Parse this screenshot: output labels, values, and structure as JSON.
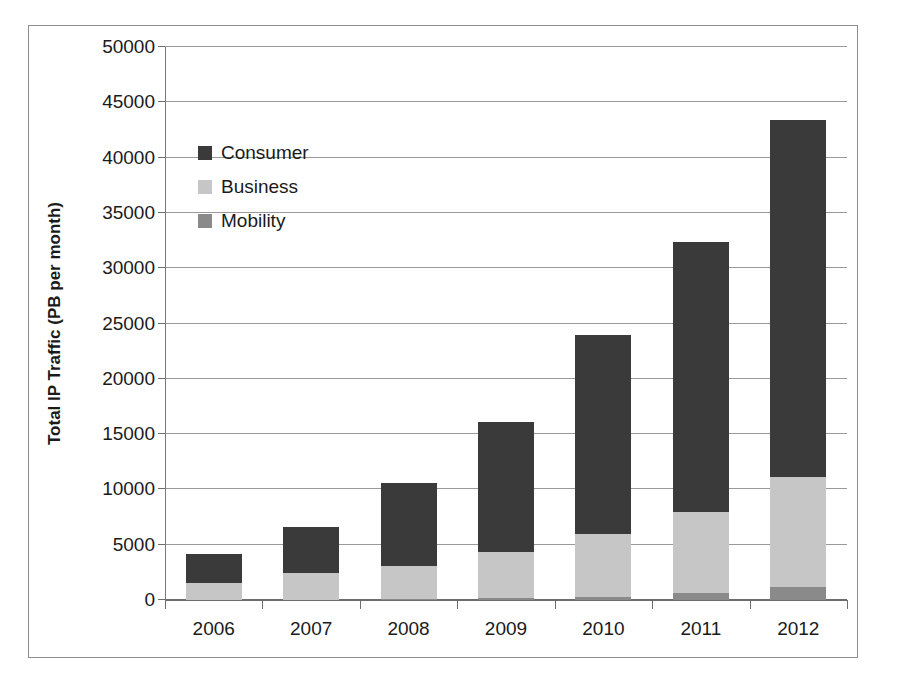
{
  "chart_data": {
    "type": "bar",
    "title": "",
    "subtitle": "",
    "xlabel": "",
    "ylabel": "Total IP Traffic (PB per month)",
    "categories": [
      "2006",
      "2007",
      "2008",
      "2009",
      "2010",
      "2011",
      "2012"
    ],
    "ylim": [
      0,
      50000
    ],
    "ytick_labels": [
      "0",
      "5000",
      "10000",
      "15000",
      "20000",
      "25000",
      "30000",
      "35000",
      "40000",
      "45000",
      "50000"
    ],
    "ytick_values": [
      0,
      5000,
      10000,
      15000,
      20000,
      25000,
      30000,
      35000,
      40000,
      45000,
      50000
    ],
    "grid": true,
    "stacked": true,
    "legend_position": "upper-left-inside",
    "series": [
      {
        "name": "Mobility",
        "color": "#8a8a8a",
        "values": [
          10,
          30,
          90,
          200,
          300,
          600,
          1200
        ]
      },
      {
        "name": "Business",
        "color": "#c6c6c6",
        "values": [
          1490,
          2370,
          3010,
          4100,
          5700,
          7400,
          9900
        ]
      },
      {
        "name": "Consumer",
        "color": "#3a3a3a",
        "values": [
          2700,
          4200,
          7500,
          11800,
          18000,
          24400,
          32300
        ]
      }
    ],
    "totals": [
      4200,
      6600,
      10600,
      16100,
      24000,
      32400,
      43400
    ],
    "stack_order_bottom_to_top": [
      "Mobility",
      "Business",
      "Consumer"
    ]
  },
  "legend": {
    "items": [
      {
        "label": "Consumer",
        "color": "#3a3a3a"
      },
      {
        "label": "Business",
        "color": "#c6c6c6"
      },
      {
        "label": "Mobility",
        "color": "#8a8a8a"
      }
    ]
  }
}
